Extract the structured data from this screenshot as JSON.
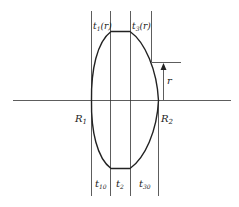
{
  "diagram": {
    "type": "lens-thickness-cross-section",
    "labels": {
      "top_left": "t",
      "top_left_sub": "1",
      "top_left_arg": "(r)",
      "top_right": "t",
      "top_right_sub": "3",
      "top_right_arg": "(r)",
      "left_radius": "R",
      "left_radius_sub": "1",
      "right_radius": "R",
      "right_radius_sub": "2",
      "height": "r",
      "bottom_left": "t",
      "bottom_left_sub": "10",
      "bottom_mid": "t",
      "bottom_mid_sub": "2",
      "bottom_right": "t",
      "bottom_right_sub": "30"
    },
    "colors": {
      "stroke": "#222222",
      "background": "#ffffff"
    }
  }
}
